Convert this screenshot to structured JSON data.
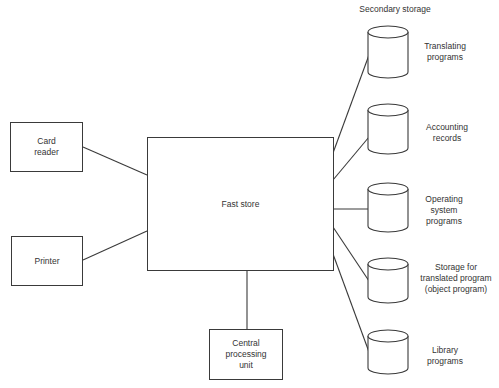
{
  "diagram": {
    "colors": {
      "stroke": "#3a3a3a",
      "text": "#333333",
      "background": "#ffffff"
    },
    "secondary_storage_title": "Secondary storage",
    "nodes": {
      "card_reader": {
        "label": "Card\nreader",
        "x": 10,
        "y": 122,
        "w": 73,
        "h": 50
      },
      "printer": {
        "label": "Printer",
        "x": 11,
        "y": 236,
        "w": 72,
        "h": 50
      },
      "fast_store": {
        "label": "Fast store",
        "x": 147,
        "y": 137,
        "w": 186,
        "h": 133
      },
      "cpu": {
        "label": "Central\nprocessing\nunit",
        "x": 209,
        "y": 329,
        "w": 74,
        "h": 50
      }
    },
    "storage": [
      {
        "label": "Translating\nprograms",
        "top": 26,
        "bottom": 78
      },
      {
        "label": "Accounting\nrecords",
        "top": 104,
        "bottom": 154
      },
      {
        "label": "Operating\nsystem\nprograms",
        "top": 183,
        "bottom": 232
      },
      {
        "label": "Storage for\ntranslated program\n(object program)",
        "top": 258,
        "bottom": 303
      },
      {
        "label": "Library\nprograms",
        "top": 330,
        "bottom": 374
      }
    ],
    "edges": [
      {
        "from": "card_reader",
        "to": "fast_store"
      },
      {
        "from": "printer",
        "to": "fast_store"
      },
      {
        "from": "fast_store",
        "to": "cpu"
      },
      {
        "from": "fast_store",
        "to": "Translating programs"
      },
      {
        "from": "fast_store",
        "to": "Accounting records"
      },
      {
        "from": "fast_store",
        "to": "Operating system programs"
      },
      {
        "from": "fast_store",
        "to": "Storage for translated program (object program)"
      },
      {
        "from": "fast_store",
        "to": "Library programs"
      }
    ]
  }
}
